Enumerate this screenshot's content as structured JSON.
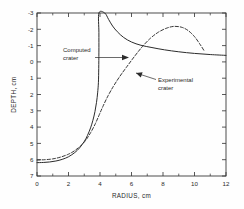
{
  "chart_data": {
    "type": "line",
    "title": "",
    "xlabel": "RADIUS, cm",
    "ylabel": "DEPTH, cm",
    "xlim": [
      0,
      12
    ],
    "ylim": [
      7,
      -3
    ],
    "y_inverted": true,
    "grid": false,
    "legend": "none",
    "x_ticks_major": [
      0,
      2,
      4,
      6,
      8,
      10,
      12
    ],
    "x_ticks_minor": [
      1,
      3,
      5,
      7,
      9,
      11
    ],
    "x_tick_labels": [
      "0",
      "2",
      "4",
      "6",
      "8",
      "10",
      "12"
    ],
    "y_ticks_major": [
      -3,
      -2,
      -1,
      0,
      1,
      2,
      3,
      4,
      5,
      6,
      7
    ],
    "y_tick_labels": [
      "-3",
      "-2",
      "-1",
      "0",
      "1",
      "2",
      "3",
      "4",
      "5",
      "6",
      "7"
    ],
    "series": [
      {
        "name": "Computed crater",
        "style": "solid",
        "points": [
          [
            0.0,
            6.18
          ],
          [
            0.4,
            6.17
          ],
          [
            0.8,
            6.14
          ],
          [
            1.2,
            6.08
          ],
          [
            1.6,
            5.98
          ],
          [
            2.0,
            5.82
          ],
          [
            2.4,
            5.56
          ],
          [
            2.7,
            5.28
          ],
          [
            3.0,
            4.88
          ],
          [
            3.2,
            4.52
          ],
          [
            3.4,
            4.05
          ],
          [
            3.55,
            3.58
          ],
          [
            3.68,
            3.05
          ],
          [
            3.78,
            2.48
          ],
          [
            3.85,
            1.9
          ],
          [
            3.9,
            1.25
          ],
          [
            3.92,
            0.4
          ],
          [
            3.93,
            -0.6
          ],
          [
            3.93,
            -1.8
          ],
          [
            3.93,
            -3.0
          ],
          [
            4.3,
            -3.0
          ],
          [
            4.55,
            -2.6
          ],
          [
            4.8,
            -2.2
          ],
          [
            5.1,
            -1.85
          ],
          [
            5.5,
            -1.5
          ],
          [
            6.0,
            -1.22
          ],
          [
            6.6,
            -1.02
          ],
          [
            7.3,
            -0.88
          ],
          [
            8.1,
            -0.74
          ],
          [
            9.0,
            -0.62
          ],
          [
            10.0,
            -0.52
          ],
          [
            11.0,
            -0.45
          ],
          [
            12.0,
            -0.4
          ]
        ]
      },
      {
        "name": "Experimental crater",
        "style": "dashed",
        "points": [
          [
            0.0,
            6.02
          ],
          [
            0.5,
            6.0
          ],
          [
            1.0,
            5.95
          ],
          [
            1.5,
            5.84
          ],
          [
            2.0,
            5.66
          ],
          [
            2.4,
            5.44
          ],
          [
            2.8,
            5.12
          ],
          [
            3.1,
            4.8
          ],
          [
            3.4,
            4.35
          ],
          [
            3.7,
            3.8
          ],
          [
            3.95,
            3.25
          ],
          [
            4.2,
            2.7
          ],
          [
            4.5,
            2.1
          ],
          [
            4.85,
            1.5
          ],
          [
            5.25,
            0.9
          ],
          [
            5.7,
            0.3
          ],
          [
            6.2,
            -0.35
          ],
          [
            6.7,
            -0.95
          ],
          [
            7.2,
            -1.45
          ],
          [
            7.7,
            -1.82
          ],
          [
            8.2,
            -2.06
          ],
          [
            8.7,
            -2.18
          ],
          [
            9.2,
            -2.12
          ],
          [
            9.6,
            -1.92
          ],
          [
            10.0,
            -1.55
          ],
          [
            10.35,
            -1.08
          ],
          [
            10.6,
            -0.7
          ]
        ]
      }
    ],
    "annotations": [
      {
        "id": "computed-crater",
        "lines": [
          "Computed",
          "crater"
        ],
        "arrow": "right",
        "text_x": 2.0,
        "text_y": -0.9
      },
      {
        "id": "experimental-crater",
        "lines": [
          "Experimental",
          "crater"
        ],
        "arrow": "leader-up-left",
        "text_x": 7.4,
        "text_y": 1.55
      }
    ]
  }
}
